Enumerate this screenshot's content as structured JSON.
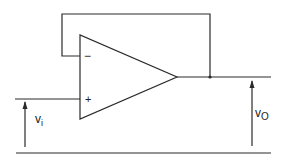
{
  "diagram": {
    "type": "op-amp voltage follower",
    "opamp": {
      "inverting_label": "−",
      "noninverting_label": "+"
    },
    "input_voltage": {
      "symbol": "v",
      "subscript": "i"
    },
    "output_voltage": {
      "symbol": "v",
      "subscript": "O"
    },
    "colors": {
      "line": "#2a2a2a",
      "background": "#ffffff"
    }
  }
}
